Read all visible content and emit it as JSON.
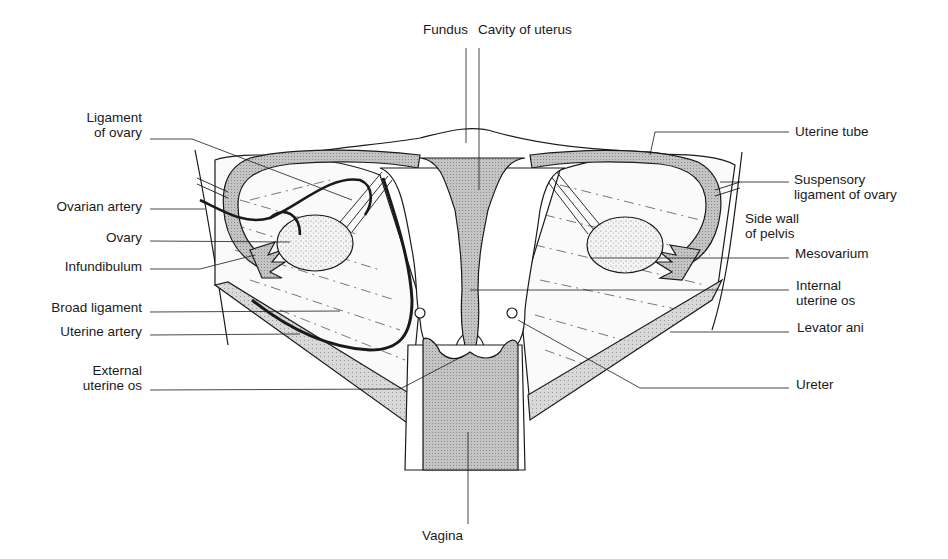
{
  "diagram": {
    "colors": {
      "stroke": "#1a1a1a",
      "shaded": "#bdbdbd",
      "shaded_dark": "#a8a8a8",
      "muscle": "#d6d6d6",
      "background": "#ffffff"
    },
    "labels": {
      "left": [
        {
          "id": "ligament-of-ovary",
          "text": "Ligament\nof ovary"
        },
        {
          "id": "ovarian-artery",
          "text": "Ovarian artery"
        },
        {
          "id": "ovary",
          "text": "Ovary"
        },
        {
          "id": "infundibulum",
          "text": "Infundibulum"
        },
        {
          "id": "broad-ligament",
          "text": "Broad ligament"
        },
        {
          "id": "uterine-artery",
          "text": "Uterine artery"
        },
        {
          "id": "external-uterine-os",
          "text": "External\nuterine os"
        }
      ],
      "top": [
        {
          "id": "fundus",
          "text": "Fundus"
        },
        {
          "id": "cavity-of-uterus",
          "text": "Cavity of uterus"
        }
      ],
      "right": [
        {
          "id": "uterine-tube",
          "text": "Uterine tube"
        },
        {
          "id": "suspensory-ligament-of-ovary",
          "text": "Suspensory\nligament of ovary"
        },
        {
          "id": "side-wall-of-pelvis",
          "text": "Side wall\nof pelvis"
        },
        {
          "id": "mesovarium",
          "text": "Mesovarium"
        },
        {
          "id": "internal-uterine-os",
          "text": "Internal\nuterine os"
        },
        {
          "id": "levator-ani",
          "text": "Levator ani"
        },
        {
          "id": "ureter",
          "text": "Ureter"
        }
      ],
      "bottom": [
        {
          "id": "vagina",
          "text": "Vagina"
        }
      ]
    }
  }
}
